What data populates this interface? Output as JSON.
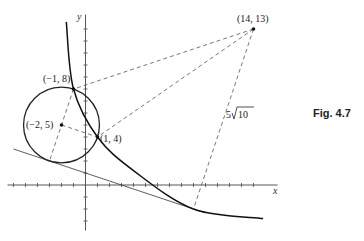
{
  "figure": {
    "caption": "Fig. 4.7",
    "x_axis_label": "x",
    "y_axis_label": "y",
    "x_ticks": [
      -6,
      -5,
      -4,
      -3,
      -2,
      -1,
      1,
      2,
      3,
      4,
      5,
      6,
      7,
      8,
      9,
      10,
      11,
      12,
      13,
      14
    ],
    "y_ticks": [
      -3,
      -2,
      -1,
      1,
      2,
      3,
      4,
      5,
      6,
      7,
      8,
      9,
      10,
      11,
      12,
      13
    ],
    "x_range": [
      -6.5,
      16
    ],
    "y_range": [
      -3.8,
      14.2
    ],
    "circle": {
      "center": [
        -2,
        5
      ],
      "radius_squared": 10
    },
    "tangent_line": {
      "equation": "x + 3y = 3",
      "x_range": [
        -6,
        10
      ]
    },
    "curve_points": [
      [
        -1.6,
        13.6
      ],
      [
        -1,
        8
      ],
      [
        1,
        4
      ],
      [
        4,
        1.2
      ],
      [
        9,
        -2
      ],
      [
        14.8,
        -2.8
      ]
    ],
    "points": [
      {
        "id": "p14_13",
        "x": 14,
        "y": 13,
        "label": "(14, 13)"
      },
      {
        "id": "p_1_8",
        "x": -1,
        "y": 8,
        "label": "(−1, 8)"
      },
      {
        "id": "p_2_5",
        "x": -2,
        "y": 5,
        "label": "(−2, 5)"
      },
      {
        "id": "p1_4",
        "x": 1,
        "y": 4,
        "label": "(1, 4)"
      }
    ],
    "dashed_segments": [
      {
        "from": [
          14,
          13
        ],
        "to": [
          -1,
          8
        ]
      },
      {
        "from": [
          14,
          13
        ],
        "to": [
          1,
          4
        ]
      },
      {
        "from": [
          14,
          13
        ],
        "to": [
          9,
          -2
        ]
      },
      {
        "from": [
          -2,
          5
        ],
        "to": [
          1,
          4
        ]
      },
      {
        "from": [
          -1,
          8
        ],
        "to": [
          -3,
          2
        ]
      }
    ],
    "distance_label": "5√10",
    "distance_label_radicand": "10",
    "distance_label_coef": "5"
  }
}
